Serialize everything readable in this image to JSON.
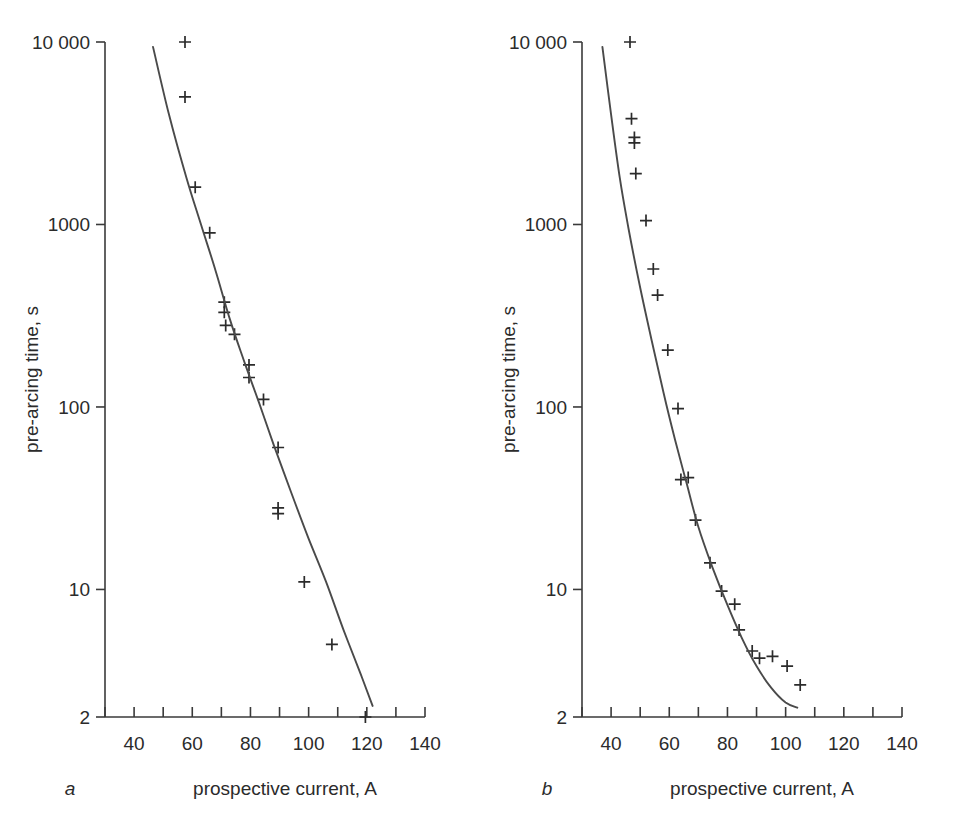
{
  "figure": {
    "panel_count": 2,
    "background_color": "#ffffff",
    "line_color": "#4a4a4a",
    "marker_color": "#2b2b2b",
    "axis_color": "#3a3a3a"
  },
  "panel_a": {
    "letter": "a",
    "xlabel": "prospective current, A",
    "ylabel": "pre-arcing time, s",
    "x_ticklabels": [
      "40",
      "60",
      "80",
      "100",
      "120",
      "140"
    ],
    "y_ticklabels": [
      "10 000",
      "1000",
      "100",
      "10",
      "2"
    ]
  },
  "panel_b": {
    "letter": "b",
    "xlabel": "prospective current, A",
    "ylabel": "pre-arcing time, s",
    "x_ticklabels": [
      "40",
      "60",
      "80",
      "100",
      "120",
      "140"
    ],
    "y_ticklabels": [
      "10 000",
      "1000",
      "100",
      "10",
      "2"
    ]
  },
  "chart_data": [
    {
      "type": "scatter",
      "id": "panel-a",
      "panel_letter": "a",
      "title": "",
      "xlabel": "prospective current, A",
      "ylabel": "pre-arcing time, s",
      "xscale": "linear",
      "yscale": "log",
      "xlim": [
        30,
        140
      ],
      "ylim": [
        2,
        10000
      ],
      "xticks": [
        30,
        40,
        50,
        60,
        70,
        80,
        90,
        100,
        110,
        120,
        130,
        140
      ],
      "xticklabels_major": [
        40,
        60,
        80,
        100,
        120,
        140
      ],
      "yticks": [
        10000,
        1000,
        100,
        10,
        2
      ],
      "yticklabels": [
        "10 000",
        "1000",
        "100",
        "10",
        "2"
      ],
      "grid": false,
      "legend": false,
      "marker": "plus",
      "series": [
        {
          "name": "measured pre-arcing times",
          "marker": "+",
          "points": [
            {
              "x": 57.5,
              "y": 10000
            },
            {
              "x": 57.5,
              "y": 5000
            },
            {
              "x": 61,
              "y": 1600
            },
            {
              "x": 66,
              "y": 900
            },
            {
              "x": 71,
              "y": 375
            },
            {
              "x": 71,
              "y": 330
            },
            {
              "x": 71.5,
              "y": 280
            },
            {
              "x": 74.5,
              "y": 250
            },
            {
              "x": 79.5,
              "y": 170
            },
            {
              "x": 79.5,
              "y": 145
            },
            {
              "x": 84.5,
              "y": 110
            },
            {
              "x": 89.5,
              "y": 60
            },
            {
              "x": 89.5,
              "y": 28
            },
            {
              "x": 89.5,
              "y": 26
            },
            {
              "x": 98.5,
              "y": 11
            },
            {
              "x": 108,
              "y": 5
            },
            {
              "x": 119.5,
              "y": 2
            }
          ]
        },
        {
          "name": "fitted characteristic",
          "type": "line",
          "points": [
            {
              "x": 46.5,
              "y": 9400
            },
            {
              "x": 52,
              "y": 4000
            },
            {
              "x": 58,
              "y": 1800
            },
            {
              "x": 63,
              "y": 1000
            },
            {
              "x": 68,
              "y": 560
            },
            {
              "x": 73,
              "y": 300
            },
            {
              "x": 78,
              "y": 175
            },
            {
              "x": 83,
              "y": 105
            },
            {
              "x": 88,
              "y": 62
            },
            {
              "x": 94,
              "y": 34
            },
            {
              "x": 100,
              "y": 19
            },
            {
              "x": 106,
              "y": 11
            },
            {
              "x": 112,
              "y": 6
            },
            {
              "x": 118,
              "y": 3.4
            },
            {
              "x": 122,
              "y": 2.3
            }
          ]
        }
      ]
    },
    {
      "type": "scatter",
      "id": "panel-b",
      "panel_letter": "b",
      "title": "",
      "xlabel": "prospective current, A",
      "ylabel": "pre-arcing time, s",
      "xscale": "linear",
      "yscale": "log",
      "xlim": [
        30,
        140
      ],
      "ylim": [
        2,
        10000
      ],
      "xticks": [
        30,
        40,
        50,
        60,
        70,
        80,
        90,
        100,
        110,
        120,
        130,
        140
      ],
      "xticklabels_major": [
        40,
        60,
        80,
        100,
        120,
        140
      ],
      "yticks": [
        10000,
        1000,
        100,
        10,
        2
      ],
      "yticklabels": [
        "10 000",
        "1000",
        "100",
        "10",
        "2"
      ],
      "grid": false,
      "legend": false,
      "marker": "plus",
      "series": [
        {
          "name": "measured pre-arcing times",
          "marker": "+",
          "points": [
            {
              "x": 46.5,
              "y": 10000
            },
            {
              "x": 47,
              "y": 3800
            },
            {
              "x": 48,
              "y": 3000
            },
            {
              "x": 48,
              "y": 2800
            },
            {
              "x": 48.5,
              "y": 1900
            },
            {
              "x": 52,
              "y": 1050
            },
            {
              "x": 54.5,
              "y": 570
            },
            {
              "x": 56,
              "y": 410
            },
            {
              "x": 59.5,
              "y": 205
            },
            {
              "x": 63,
              "y": 98
            },
            {
              "x": 64,
              "y": 40
            },
            {
              "x": 66.5,
              "y": 41
            },
            {
              "x": 69,
              "y": 24
            },
            {
              "x": 74,
              "y": 14
            },
            {
              "x": 78,
              "y": 9.8
            },
            {
              "x": 82.5,
              "y": 8.3
            },
            {
              "x": 84,
              "y": 6.0
            },
            {
              "x": 88.5,
              "y": 4.6
            },
            {
              "x": 91,
              "y": 4.2
            },
            {
              "x": 95.5,
              "y": 4.3
            },
            {
              "x": 100.5,
              "y": 3.8
            },
            {
              "x": 105,
              "y": 3.0
            }
          ]
        },
        {
          "name": "fitted characteristic",
          "type": "line",
          "points": [
            {
              "x": 37,
              "y": 9400
            },
            {
              "x": 40,
              "y": 4000
            },
            {
              "x": 43,
              "y": 1800
            },
            {
              "x": 46,
              "y": 950
            },
            {
              "x": 50,
              "y": 450
            },
            {
              "x": 54,
              "y": 230
            },
            {
              "x": 58,
              "y": 120
            },
            {
              "x": 62,
              "y": 66
            },
            {
              "x": 66,
              "y": 38
            },
            {
              "x": 70,
              "y": 22
            },
            {
              "x": 75,
              "y": 13
            },
            {
              "x": 80,
              "y": 8.2
            },
            {
              "x": 85,
              "y": 5.4
            },
            {
              "x": 90,
              "y": 3.8
            },
            {
              "x": 95,
              "y": 2.9
            },
            {
              "x": 100,
              "y": 2.4
            },
            {
              "x": 104,
              "y": 2.25
            }
          ]
        }
      ]
    }
  ]
}
